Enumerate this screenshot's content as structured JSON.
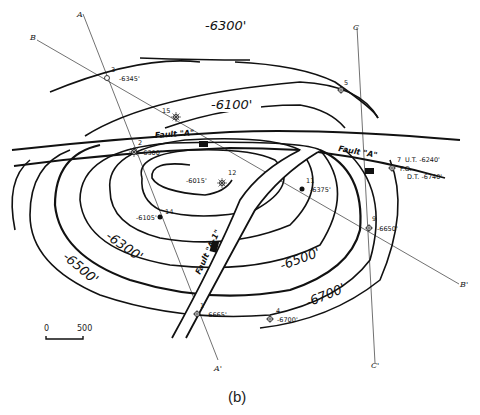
{
  "figure": {
    "caption": "(b)",
    "type": "structure contour map with faults"
  },
  "contours": [
    {
      "label": "-6300'",
      "position": "top"
    },
    {
      "label": "-6100'",
      "position": "upper"
    },
    {
      "label": "-6300'",
      "position": "lower-left"
    },
    {
      "label": "-6500'",
      "position": "left"
    },
    {
      "label": "-6500'",
      "position": "lower-right"
    },
    {
      "label": "-6700'",
      "position": "lower-right-outer"
    }
  ],
  "faults": [
    {
      "name": "Fault \"A\"",
      "label_pos": "left"
    },
    {
      "name": "Fault \"A\"",
      "label_pos": "right"
    },
    {
      "name": "Fault \"A-1\"",
      "label_pos": "center"
    }
  ],
  "wells": [
    {
      "id": "1",
      "depth": "-6665'",
      "symbol": "dry-hole"
    },
    {
      "id": "2",
      "depth": "-6300'",
      "symbol": "gas-well"
    },
    {
      "id": "3",
      "depth": "-6345'",
      "symbol": "dry-hole"
    },
    {
      "id": "4",
      "depth": "-6700'",
      "symbol": "dry-hole"
    },
    {
      "id": "5",
      "depth": "",
      "symbol": "dry-hole"
    },
    {
      "id": "7",
      "depth": "",
      "ut": "U.T. -6240'",
      "fo": "F.O.",
      "dt": "D.T. -6740'",
      "symbol": "dry-hole"
    },
    {
      "id": "9",
      "depth": "-6650'",
      "symbol": "dry-hole"
    },
    {
      "id": "11",
      "depth": "-6375'",
      "symbol": "oil-well"
    },
    {
      "id": "12",
      "depth": "-6015'",
      "symbol": "gas-well"
    },
    {
      "id": "14",
      "depth": "-6105'",
      "symbol": "oil-well"
    },
    {
      "id": "15",
      "depth": "",
      "symbol": "gas-well"
    }
  ],
  "cross_sections": [
    {
      "start": "A",
      "end": "A'"
    },
    {
      "start": "B",
      "end": "B'"
    },
    {
      "start": "C",
      "end": "C'"
    }
  ],
  "scale_bar": {
    "start": "0",
    "end": "500"
  }
}
